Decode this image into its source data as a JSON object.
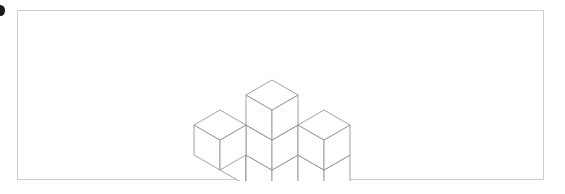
{
  "page": {
    "background_color": "#ffffff",
    "width": 565,
    "height": 194
  },
  "edge_mark": {
    "icon": "bullet-dot-clipped",
    "color": "#1a1a1a"
  },
  "figure": {
    "frame": {
      "border_color": "#cdcdcd",
      "background_color": "#ffffff",
      "x": 17,
      "y": 10,
      "width": 527,
      "height": 170
    },
    "caption": "",
    "title": ""
  },
  "chart_data": {
    "type": "diagram",
    "subtype": "isometric-cube-stack",
    "title": "",
    "xlabel": "",
    "ylabel": "",
    "stroke_color": "#8a8a8a",
    "face_color": "#ffffff",
    "stroke_width": 0.8,
    "projection": {
      "half_width": 26,
      "half_depth": 15,
      "cube_height": 30,
      "origin_x": 272,
      "origin_y": 140
    },
    "cube_count": 9,
    "cubes": [
      {
        "id": "c1",
        "x": 0,
        "y": 0,
        "z": 0,
        "label": "bottom-front-center"
      },
      {
        "id": "c2",
        "x": 1,
        "y": 0,
        "z": 0,
        "label": "bottom-front-right"
      },
      {
        "id": "c3",
        "x": 0,
        "y": 1,
        "z": 0,
        "label": "bottom-left"
      },
      {
        "id": "c4",
        "x": 1,
        "y": 1,
        "z": 0,
        "label": "bottom-center"
      },
      {
        "id": "c5",
        "x": 2,
        "y": 0,
        "z": 0,
        "label": "bottom-right"
      },
      {
        "id": "c6",
        "x": 1,
        "y": 1,
        "z": 1,
        "label": "middle-center"
      },
      {
        "id": "c7",
        "x": 0,
        "y": 2,
        "z": 1,
        "label": "middle-left"
      },
      {
        "id": "c8",
        "x": 2,
        "y": 0,
        "z": 1,
        "label": "middle-right"
      },
      {
        "id": "c9",
        "x": 1,
        "y": 1,
        "z": 2,
        "label": "top-apex"
      }
    ],
    "bounds": {
      "left": 226,
      "right": 328,
      "top": 29,
      "bottom": 155
    },
    "legend": [],
    "annotations": []
  }
}
